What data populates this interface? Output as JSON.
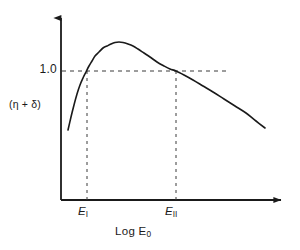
{
  "figure": {
    "background_color": "#ffffff",
    "ink_color": "#1a1a1a",
    "width": 300,
    "height": 250
  },
  "axes": {
    "y_axis_name": "vertical-axis-with-arrow",
    "x_axis_name": "horizontal-axis-with-arrow",
    "origin_px": [
      61,
      200
    ],
    "y_arrow_tip_px": [
      61,
      13
    ],
    "x_arrow_tip_px": [
      287,
      200
    ]
  },
  "labels": {
    "y_axis_label": "(η + δ)",
    "y_tick_1_0": "1.0",
    "x_tick_1_base": "E",
    "x_tick_1_sub": "I",
    "x_tick_2_base": "E",
    "x_tick_2_sub": "II",
    "x_axis_label_base": "Log E",
    "x_axis_label_sub": "0"
  },
  "chart_data": {
    "type": "line",
    "title": "",
    "xlabel": "Log E₀",
    "ylabel": "(η + δ)",
    "grid": false,
    "legend": null,
    "xlim": [
      0,
      1
    ],
    "ylim": [
      0,
      1
    ],
    "series": [
      {
        "name": "eta-plus-delta-curve",
        "style": "solid",
        "color": "#1a1a1a",
        "description": "Rises steeply from low value, crosses 1.0 at E_I, peaks above 1.0, then declines nearly linearly crossing 1.0 again at E_II and continuing downward.",
        "points_px": [
          [
            68,
            130
          ],
          [
            71,
            117
          ],
          [
            74,
            105
          ],
          [
            77,
            94
          ],
          [
            80,
            85
          ],
          [
            83,
            78
          ],
          [
            86,
            72
          ],
          [
            89,
            66
          ],
          [
            92,
            61
          ],
          [
            95,
            56
          ],
          [
            99,
            52
          ],
          [
            103,
            48
          ],
          [
            107,
            46
          ],
          [
            111,
            44
          ],
          [
            115,
            42.5
          ],
          [
            119,
            42
          ],
          [
            123,
            42.5
          ],
          [
            128,
            44
          ],
          [
            133,
            46
          ],
          [
            138,
            49
          ],
          [
            144,
            53
          ],
          [
            150,
            57
          ],
          [
            157,
            62
          ],
          [
            164,
            66
          ],
          [
            170,
            69
          ],
          [
            176,
            71
          ],
          [
            184,
            75
          ],
          [
            193,
            80
          ],
          [
            203,
            86
          ],
          [
            213,
            92
          ],
          [
            224,
            99
          ],
          [
            235,
            106
          ],
          [
            246,
            113
          ],
          [
            256,
            121
          ],
          [
            265,
            128
          ]
        ]
      }
    ],
    "reference_lines": [
      {
        "name": "unity-horizontal-dashed",
        "orientation": "horizontal",
        "value_label": "1.0",
        "style": "dashed",
        "from_px": [
          62,
          71
        ],
        "to_px": [
          228,
          71
        ]
      },
      {
        "name": "e1-vertical-dashed",
        "orientation": "vertical",
        "value_label": "E_I",
        "style": "dashed",
        "from_px": [
          87,
          71
        ],
        "to_px": [
          87,
          200
        ]
      },
      {
        "name": "e2-vertical-dashed",
        "orientation": "vertical",
        "value_label": "E_II",
        "style": "dashed",
        "from_px": [
          176,
          71
        ],
        "to_px": [
          176,
          200
        ]
      }
    ],
    "tick_marks": [
      {
        "axis": "x",
        "label": "E_I",
        "x_px": 87
      },
      {
        "axis": "x",
        "label": "E_II",
        "x_px": 176
      },
      {
        "axis": "y",
        "label": "1.0",
        "y_px": 71
      }
    ]
  }
}
